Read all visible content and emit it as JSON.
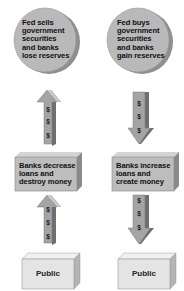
{
  "diagram": {
    "left_column": {
      "top_node": {
        "shape": "circle",
        "lines": [
          "Fed sells",
          "government",
          "securities",
          "and banks",
          "lose reserves"
        ]
      },
      "upper_arrow": {
        "direction": "up",
        "symbols": [
          "$",
          "$",
          "$"
        ]
      },
      "middle_node": {
        "shape": "box",
        "lines": [
          "Banks decrease",
          "loans and",
          "destroy money"
        ]
      },
      "lower_arrow": {
        "direction": "up",
        "symbols": [
          "$",
          "$",
          "$"
        ]
      },
      "bottom_node": {
        "shape": "box",
        "label": "Public"
      }
    },
    "right_column": {
      "top_node": {
        "shape": "circle",
        "lines": [
          "Fed buys",
          "government",
          "securities",
          "and banks",
          "gain reserves"
        ]
      },
      "upper_arrow": {
        "direction": "down",
        "symbols": [
          "$",
          "$",
          "$"
        ]
      },
      "middle_node": {
        "shape": "box",
        "lines": [
          "Banks increase",
          "loans and",
          "create money"
        ]
      },
      "lower_arrow": {
        "direction": "down",
        "symbols": [
          "$",
          "$",
          "$"
        ]
      },
      "bottom_node": {
        "shape": "box",
        "label": "Public"
      }
    },
    "colors": {
      "circle_fill": "#b9b9b9",
      "circle_edge": "#8f8f8f",
      "arrow_fill": "#a4a4a4",
      "arrow_dark": "#6f6f6f",
      "arrow_light": "#c9c9c9",
      "middle_box_fill": "#bdbdbd",
      "middle_box_side": "#8a8a8a",
      "public_box_fill": "#e4e4e4",
      "public_box_side": "#b4b4b4"
    }
  }
}
